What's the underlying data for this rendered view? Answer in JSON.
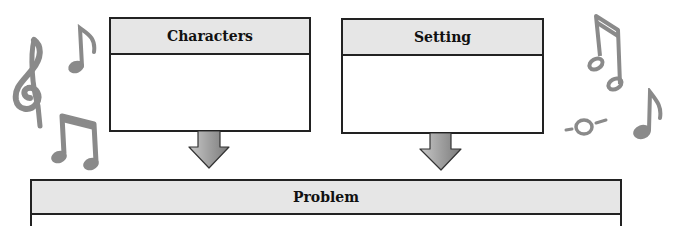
{
  "diagram": {
    "type": "story-map graphic organizer",
    "boxes": [
      {
        "id": "characters",
        "label": "Characters",
        "content": ""
      },
      {
        "id": "setting",
        "label": "Setting",
        "content": ""
      },
      {
        "id": "problem",
        "label": "Problem",
        "content": ""
      }
    ],
    "arrows": [
      {
        "from": "characters",
        "to": "problem"
      },
      {
        "from": "setting",
        "to": "problem"
      }
    ],
    "decorations": [
      "treble-clef",
      "eighth-note",
      "beamed-eighth-notes",
      "beamed-eighth-notes",
      "eighth-note",
      "whole-note"
    ]
  },
  "colors": {
    "border": "#222222",
    "header_fill": "#e6e6e6",
    "arrow_fill": "#9a9a9a",
    "music_gray": "#8a8a8a"
  }
}
